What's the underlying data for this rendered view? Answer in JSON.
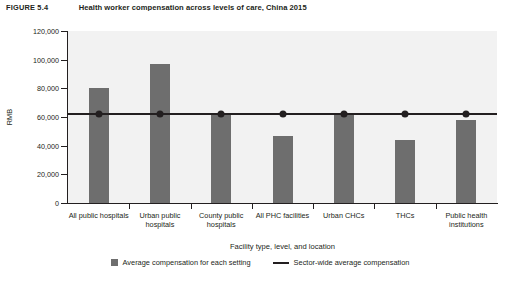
{
  "figure": {
    "label": "FIGURE 5.4",
    "title": "Health worker compensation across levels of care, China 2015"
  },
  "chart_data": {
    "type": "bar",
    "title": "Health worker compensation across levels of care, China 2015",
    "xlabel": "Facility type, level, and location",
    "ylabel": "RMB",
    "ylim": [
      0,
      120000
    ],
    "ytick_labels": [
      "0",
      "20,000",
      "40,000",
      "60,000",
      "80,000",
      "100,000",
      "120,000"
    ],
    "ytick_values": [
      0,
      20000,
      40000,
      60000,
      80000,
      100000,
      120000
    ],
    "grid": false,
    "legend_position": "bottom",
    "categories": [
      "All public hospitals",
      "Urban public hospitals",
      "County public hospitals",
      "All PHC facilities",
      "Urban CHCs",
      "THCs",
      "Public health institutions"
    ],
    "series": [
      {
        "name": "Average compensation for each setting",
        "type": "bar",
        "color": "#6e6e6e",
        "values": [
          80500,
          97000,
          62000,
          47000,
          62000,
          44000,
          58000
        ]
      },
      {
        "name": "Sector-wide average compensation",
        "type": "line",
        "color": "#231f20",
        "marker": "circle",
        "value": 62000,
        "values": [
          62000,
          62000,
          62000,
          62000,
          62000,
          62000,
          62000
        ]
      }
    ]
  },
  "legend": {
    "items": [
      {
        "label": "Average compensation for each setting",
        "swatch": "square-swatch"
      },
      {
        "label": "Sector-wide average compensation",
        "swatch": "line-swatch"
      }
    ]
  }
}
